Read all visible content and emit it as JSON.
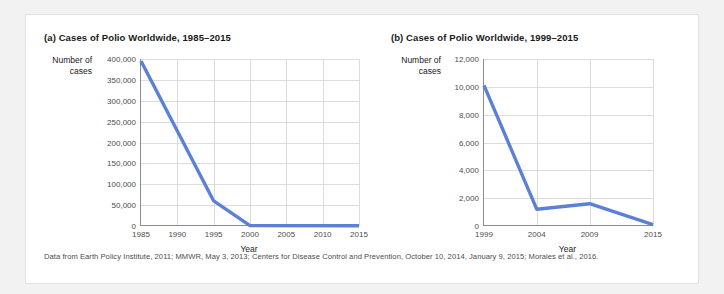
{
  "figure": {
    "source_note": "Data from Earth Policy Institute, 2011; MMWR, May 3, 2013; Centers for Disease Control and Prevention, October 10, 2014, January 9, 2015; Morales et al., 2016.",
    "line_color": "#5b80d6",
    "grid_color": "#dcdcdc",
    "axis_color": "#8c8c8c"
  },
  "chart_data": [
    {
      "type": "line",
      "panel": "a",
      "title": "(a) Cases of Polio Worldwide, 1985–2015",
      "xlabel": "Year",
      "ylabel": "Number of cases",
      "ylabel_lines": [
        "Number of",
        "cases"
      ],
      "x": [
        1985,
        1995,
        2000,
        2015
      ],
      "values": [
        395000,
        60000,
        1000,
        500
      ],
      "xlim": [
        1985,
        2015
      ],
      "ylim": [
        0,
        400000
      ],
      "xticks": [
        1985,
        1990,
        1995,
        2000,
        2005,
        2010,
        2015
      ],
      "xticklabels": [
        "1985",
        "1990",
        "1995",
        "2000",
        "2005",
        "2010",
        "2015"
      ],
      "yticks": [
        0,
        50000,
        100000,
        150000,
        200000,
        250000,
        300000,
        350000,
        400000
      ],
      "yticklabels": [
        "0",
        "50,000",
        "100,000",
        "150,000",
        "200,000",
        "250,000",
        "300,000",
        "350,000",
        "400,000"
      ],
      "grid": true,
      "legend": "none"
    },
    {
      "type": "line",
      "panel": "b",
      "title": "(b) Cases of Polio Worldwide, 1999–2015",
      "xlabel": "Year",
      "ylabel": "Number of cases",
      "ylabel_lines": [
        "Number of",
        "cases"
      ],
      "x": [
        1999,
        2004,
        2009,
        2015
      ],
      "values": [
        10100,
        1200,
        1600,
        100
      ],
      "xlim": [
        1999,
        2015
      ],
      "ylim": [
        0,
        12000
      ],
      "xticks": [
        1999,
        2004,
        2009,
        2015
      ],
      "xticklabels": [
        "1999",
        "2004",
        "2009",
        "2015"
      ],
      "yticks": [
        0,
        2000,
        4000,
        6000,
        8000,
        10000,
        12000
      ],
      "yticklabels": [
        "0",
        "2,000",
        "4,000",
        "6,000",
        "8,000",
        "10,000",
        "12,000"
      ],
      "grid": true,
      "legend": "none"
    }
  ]
}
